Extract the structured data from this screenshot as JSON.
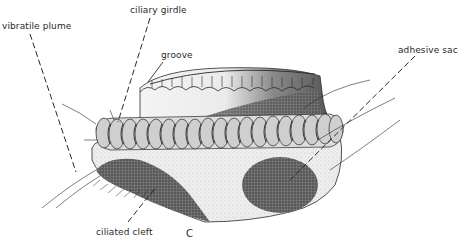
{
  "figure": {
    "panel_letter": "C",
    "labels": {
      "vibratile_plume": "vibratile plume",
      "ciliary_girdle": "ciliary girdle",
      "groove": "groove",
      "adhesive_sac": "adhesive sac",
      "ciliated_cleft": "ciliated cleft"
    },
    "colors": {
      "ink": "#2a2a2a",
      "stipple_dark": "#555555",
      "stipple_light": "#d8d8d8",
      "background": "#ffffff"
    }
  }
}
